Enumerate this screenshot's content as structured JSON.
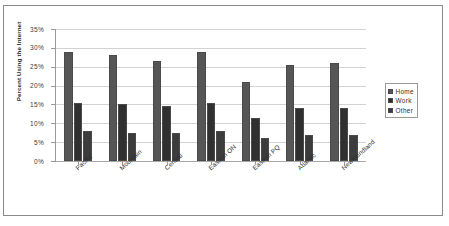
{
  "chart_data": {
    "type": "bar",
    "title": "",
    "xlabel": "",
    "ylabel": "Percent Using the Internet",
    "ylim": [
      0,
      35
    ],
    "ytick_labels": [
      "35%",
      "30%",
      "25%",
      "20%",
      "15%",
      "10%",
      "5%",
      "0%"
    ],
    "ytick_values": [
      35,
      30,
      25,
      20,
      15,
      10,
      5,
      0
    ],
    "grid": true,
    "legend_position": "right",
    "categories": [
      "Pacific",
      "Mountain",
      "Central",
      "Eastern ON",
      "Eastern PQ",
      "Atlantic",
      "Newfoundland"
    ],
    "series": [
      {
        "name": "Home",
        "color": "#565656",
        "values": [
          29.0,
          28.0,
          26.5,
          29.0,
          21.0,
          25.5,
          26.0
        ]
      },
      {
        "name": "Work",
        "color": "#303030",
        "values": [
          15.5,
          15.0,
          14.5,
          15.5,
          11.5,
          14.0,
          14.0
        ]
      },
      {
        "name": "Other",
        "color": "#3c3c3c",
        "values": [
          8.0,
          7.5,
          7.5,
          8.0,
          6.0,
          7.0,
          7.0
        ]
      }
    ]
  }
}
